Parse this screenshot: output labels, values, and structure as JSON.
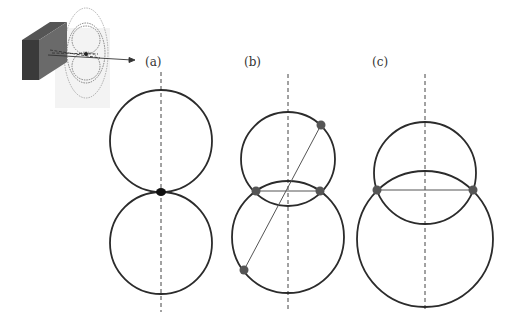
{
  "figure": {
    "panels": [
      {
        "label": "(a)",
        "description": "Two equal circles touching at a single point on the vertical axis"
      },
      {
        "label": "(b)",
        "description": "Two overlapping circles with three marked intersection/tangent points and a diagonal chord"
      },
      {
        "label": "(c)",
        "description": "Two overlapping circles of different sizes with two intersection points joined by a horizontal chord"
      }
    ],
    "inset": {
      "description": "3D sketch of a block emitting beams through lobed dotted circle patterns"
    },
    "colors": {
      "stroke": "#2b2b2b",
      "point": "#555555",
      "block_dark": "#3a3a3a",
      "block_side": "#6a6a6a",
      "plane": "#eeeeee"
    }
  }
}
